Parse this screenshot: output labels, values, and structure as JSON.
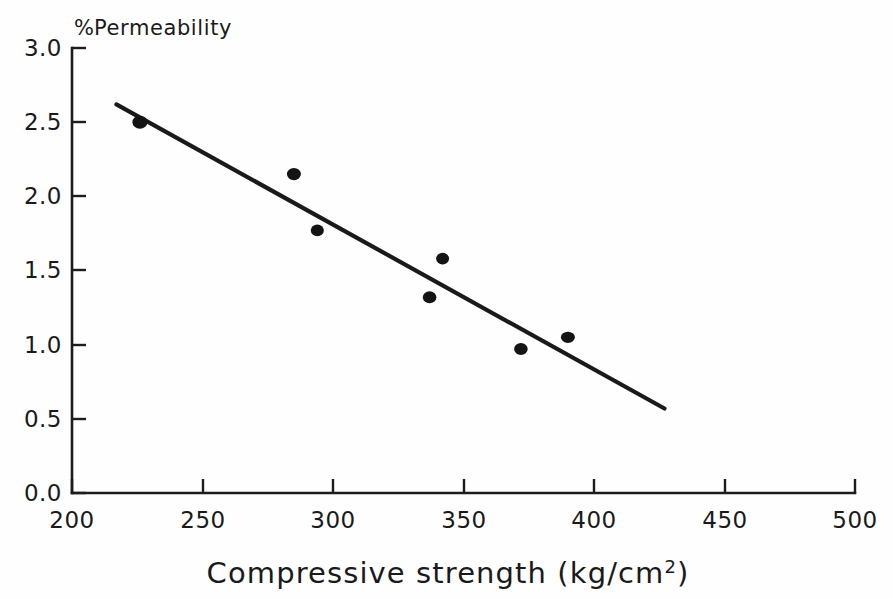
{
  "chart_data": {
    "type": "scatter",
    "title": "",
    "xlabel": "Compressive strength (kg/cm²)",
    "ylabel": "% Permeability",
    "ylabel_position": "top-left-horizontal",
    "xlim": [
      200,
      500
    ],
    "ylim": [
      0.0,
      3.0
    ],
    "xticks": [
      200,
      250,
      300,
      350,
      400,
      450,
      500
    ],
    "yticks": [
      0.0,
      0.5,
      1.0,
      1.5,
      2.0,
      2.5,
      3.0
    ],
    "xtick_labels": [
      "200",
      "250",
      "300",
      "350",
      "400",
      "450",
      "500"
    ],
    "ytick_labels": [
      "0.0",
      "0.5",
      "1.0",
      "1.5",
      "2.0",
      "2.5",
      "3.0"
    ],
    "grid": false,
    "legend": false,
    "spines": [
      "left",
      "bottom"
    ],
    "tick_direction": "in",
    "series": [
      {
        "name": "observations",
        "type": "scatter",
        "marker": "filled-circle",
        "color": "#141414",
        "points": [
          {
            "x": 226,
            "y": 2.5
          },
          {
            "x": 285,
            "y": 2.15
          },
          {
            "x": 294,
            "y": 1.77
          },
          {
            "x": 342,
            "y": 1.58
          },
          {
            "x": 337,
            "y": 1.32
          },
          {
            "x": 372,
            "y": 0.97
          },
          {
            "x": 390,
            "y": 1.05
          }
        ]
      },
      {
        "name": "regression-line",
        "type": "line",
        "color": "#1a1a1a",
        "endpoints": [
          {
            "x": 217,
            "y": 2.62
          },
          {
            "x": 427,
            "y": 0.57
          }
        ]
      }
    ]
  },
  "axis": {
    "ylabel_percent": "%",
    "ylabel_word": "Permeability",
    "xlabel_main": "Compressive strength (kg/cm",
    "xlabel_sup": "2",
    "xlabel_close": ")"
  }
}
